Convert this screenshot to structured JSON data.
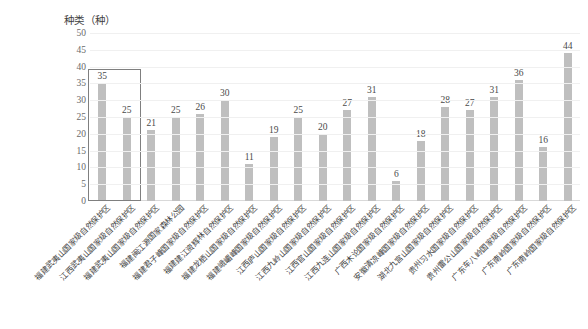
{
  "chart_data": {
    "type": "bar",
    "title": "",
    "ylabel": "种类（种）",
    "xlabel": "",
    "ylim": [
      0,
      50
    ],
    "yticks": [
      0,
      5,
      10,
      15,
      20,
      25,
      30,
      35,
      40,
      45,
      50
    ],
    "grid": true,
    "legend": "none",
    "bar_color": "#bfbfbf",
    "highlight": {
      "label": "highlight-box",
      "covers_categories": [
        0,
        1
      ],
      "border_color": "#7f7f7f"
    },
    "categories": [
      "福建武夷山国家级自然保护区",
      "江西武夷山国家级自然保护区",
      "福建武夷山国家级自然保护区",
      "福建闽江源国家森林公园",
      "福建君子峰国家级自然保护区",
      "福建建江资辉林自然保护区",
      "福建龙栖山国家级自然保护区",
      "福建峨嵋峰国家级自然保护区",
      "江西庐山国家级自然保护区",
      "江西九岭山国家级自然保护区",
      "江西官山国家级自然保护区",
      "江西九连山国家级自然保护区",
      "广西木论国家级自然保护区",
      "安徽清凉峰国家级自然保护区",
      "湖北九宫山国家级自然保护区",
      "贵州习水国家级自然保护区",
      "贵州雷公山国家级自然保护区",
      "广东车八岭国家级自然保护区",
      "广东南岭国家级自然保护区",
      "广东南岭国家级自然保护区"
    ],
    "values": [
      35,
      25,
      21,
      25,
      26,
      30,
      11,
      19,
      25,
      20,
      27,
      31,
      6,
      18,
      28,
      27,
      31,
      36,
      16,
      44
    ]
  }
}
